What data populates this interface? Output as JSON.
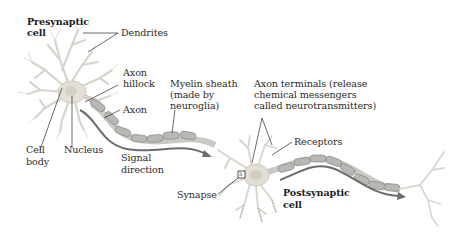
{
  "figure": {
    "colors": {
      "background": "#ffffff",
      "cell": "#e6e3dc",
      "cell_outline": "#cfcac0",
      "myelin": "#b9b9b6",
      "myelin_outline": "#8e8e8a",
      "arrow": "#6d6d6d",
      "leader_line": "#2b2b2b",
      "text": "#2b2b2b"
    },
    "labels": {
      "presynaptic_cell": {
        "line1": "Presynaptic",
        "line2": "cell"
      },
      "dendrites": "Dendrites",
      "axon_hillock": {
        "line1": "Axon",
        "line2": "hillock"
      },
      "axon": "Axon",
      "myelin_sheath": {
        "line1": "Myelin sheath",
        "line2": "(made by",
        "line3": "neuroglia)"
      },
      "axon_terminals": {
        "line1": "Axon terminals (release",
        "line2": "chemical messengers",
        "line3": "called neurotransmitters)"
      },
      "receptors": "Receptors",
      "cell_body": {
        "line1": "Cell",
        "line2": "body"
      },
      "nucleus": "Nucleus",
      "signal_direction": {
        "line1": "Signal",
        "line2": "direction"
      },
      "synapse": "Synapse",
      "synapse_box": "3",
      "postsynaptic_cell": {
        "line1": "Postsynaptic",
        "line2": "cell"
      }
    }
  }
}
